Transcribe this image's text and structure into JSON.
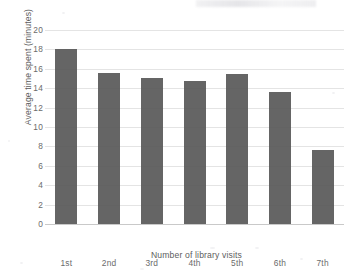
{
  "chart_data": {
    "type": "bar",
    "title": "",
    "xlabel": "Number of library visits",
    "ylabel": "Average time spent (minutes)",
    "categories": [
      "1st",
      "2nd",
      "3rd",
      "4th",
      "5th",
      "6th",
      "7th"
    ],
    "values": [
      18.0,
      15.6,
      15.1,
      14.7,
      15.5,
      13.6,
      7.6
    ],
    "ylim": [
      0,
      20
    ],
    "ytick_labels": [
      "0",
      "2",
      "4",
      "6",
      "8",
      "10",
      "12",
      "14",
      "16",
      "18",
      "20"
    ],
    "ytick_values": [
      0,
      2,
      4,
      6,
      8,
      10,
      12,
      14,
      16,
      18,
      20
    ],
    "grid": true,
    "legend": "none",
    "series": [
      {
        "name": "Average time spent (minutes)",
        "values": [
          18.0,
          15.6,
          15.1,
          14.7,
          15.5,
          13.6,
          7.6
        ]
      }
    ],
    "bar_color": "#595959",
    "grid_color": "#e4e4e4",
    "text_color": "#6b6b6b",
    "background_color": "#ffffff"
  }
}
